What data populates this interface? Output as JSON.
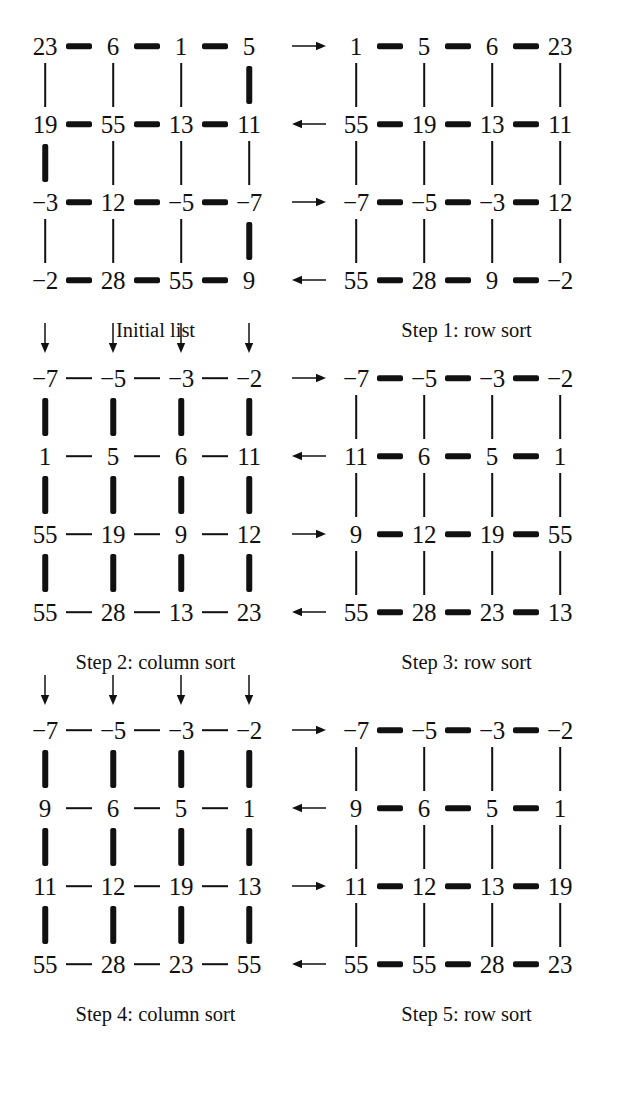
{
  "figure": {
    "ink_color": "#111111",
    "background_color": "#ffffff"
  },
  "chart_data": {
    "type": "diagram",
    "grid": {
      "rows": 4,
      "cols": 4
    },
    "panels": [
      {
        "id": "initial",
        "caption": "Initial list",
        "sort_kind": "none",
        "rows": [
          [
            "23",
            "6",
            "1",
            "5"
          ],
          [
            "19",
            "55",
            "13",
            "11"
          ],
          [
            "−3",
            "12",
            "−5",
            "−7"
          ],
          [
            "−2",
            "28",
            "55",
            "9"
          ]
        ],
        "row_arrows": [],
        "col_arrows": [],
        "h_edges": [
          [
            "thick",
            "thick",
            "thick"
          ],
          [
            "thick",
            "thick",
            "thick"
          ],
          [
            "thick",
            "thick",
            "thick"
          ],
          [
            "thick",
            "thick",
            "thick"
          ]
        ],
        "v_edges": [
          [
            "thin",
            "thin",
            "thin",
            "thick"
          ],
          [
            "thick",
            "thin",
            "thin",
            "thin"
          ],
          [
            "thin",
            "thin",
            "thin",
            "thick"
          ]
        ]
      },
      {
        "id": "step1",
        "caption": "Step 1: row sort",
        "sort_kind": "row",
        "rows": [
          [
            "1",
            "5",
            "6",
            "23"
          ],
          [
            "55",
            "19",
            "13",
            "11"
          ],
          [
            "−7",
            "−5",
            "−3",
            "12"
          ],
          [
            "55",
            "28",
            "9",
            "−2"
          ]
        ],
        "row_arrows": [
          "right",
          "left",
          "right",
          "left"
        ],
        "col_arrows": [],
        "h_edges": [
          [
            "thick",
            "thick",
            "thick"
          ],
          [
            "thick",
            "thick",
            "thick"
          ],
          [
            "thick",
            "thick",
            "thick"
          ],
          [
            "thick",
            "thick",
            "thick"
          ]
        ],
        "v_edges": [
          [
            "thin",
            "thin",
            "thin",
            "thin"
          ],
          [
            "thin",
            "thin",
            "thin",
            "thin"
          ],
          [
            "thin",
            "thin",
            "thin",
            "thin"
          ]
        ]
      },
      {
        "id": "step2",
        "caption": "Step 2: column sort",
        "sort_kind": "column",
        "rows": [
          [
            "−7",
            "−5",
            "−3",
            "−2"
          ],
          [
            "1",
            "5",
            "6",
            "11"
          ],
          [
            "55",
            "19",
            "9",
            "12"
          ],
          [
            "55",
            "28",
            "13",
            "23"
          ]
        ],
        "row_arrows": [],
        "col_arrows": [
          "down",
          "down",
          "down",
          "down"
        ],
        "h_edges": [
          [
            "thin",
            "thin",
            "thin"
          ],
          [
            "thin",
            "thin",
            "thin"
          ],
          [
            "thin",
            "thin",
            "thin"
          ],
          [
            "thin",
            "thin",
            "thin"
          ]
        ],
        "v_edges": [
          [
            "thick",
            "thick",
            "thick",
            "thick"
          ],
          [
            "thick",
            "thick",
            "thick",
            "thick"
          ],
          [
            "thick",
            "thick",
            "thick",
            "thick"
          ]
        ]
      },
      {
        "id": "step3",
        "caption": "Step 3: row sort",
        "sort_kind": "row",
        "rows": [
          [
            "−7",
            "−5",
            "−3",
            "−2"
          ],
          [
            "11",
            "6",
            "5",
            "1"
          ],
          [
            "9",
            "12",
            "19",
            "55"
          ],
          [
            "55",
            "28",
            "23",
            "13"
          ]
        ],
        "row_arrows": [
          "right",
          "left",
          "right",
          "left"
        ],
        "col_arrows": [],
        "h_edges": [
          [
            "thick",
            "thick",
            "thick"
          ],
          [
            "thick",
            "thick",
            "thick"
          ],
          [
            "thick",
            "thick",
            "thick"
          ],
          [
            "thick",
            "thick",
            "thick"
          ]
        ],
        "v_edges": [
          [
            "thin",
            "thin",
            "thin",
            "thin"
          ],
          [
            "thin",
            "thin",
            "thin",
            "thin"
          ],
          [
            "thin",
            "thin",
            "thin",
            "thin"
          ]
        ]
      },
      {
        "id": "step4",
        "caption": "Step 4: column sort",
        "sort_kind": "column",
        "rows": [
          [
            "−7",
            "−5",
            "−3",
            "−2"
          ],
          [
            "9",
            "6",
            "5",
            "1"
          ],
          [
            "11",
            "12",
            "19",
            "13"
          ],
          [
            "55",
            "28",
            "23",
            "55"
          ]
        ],
        "row_arrows": [],
        "col_arrows": [
          "down",
          "down",
          "down",
          "down"
        ],
        "h_edges": [
          [
            "thin",
            "thin",
            "thin"
          ],
          [
            "thin",
            "thin",
            "thin"
          ],
          [
            "thin",
            "thin",
            "thin"
          ],
          [
            "thin",
            "thin",
            "thin"
          ]
        ],
        "v_edges": [
          [
            "thick",
            "thick",
            "thick",
            "thick"
          ],
          [
            "thick",
            "thick",
            "thick",
            "thick"
          ],
          [
            "thick",
            "thick",
            "thick",
            "thick"
          ]
        ]
      },
      {
        "id": "step5",
        "caption": "Step 5: row sort",
        "sort_kind": "row",
        "rows": [
          [
            "−7",
            "−5",
            "−3",
            "−2"
          ],
          [
            "9",
            "6",
            "5",
            "1"
          ],
          [
            "11",
            "12",
            "13",
            "19"
          ],
          [
            "55",
            "55",
            "28",
            "23"
          ]
        ],
        "row_arrows": [
          "right",
          "left",
          "right",
          "left"
        ],
        "col_arrows": [],
        "h_edges": [
          [
            "thick",
            "thick",
            "thick"
          ],
          [
            "thick",
            "thick",
            "thick"
          ],
          [
            "thick",
            "thick",
            "thick"
          ],
          [
            "thick",
            "thick",
            "thick"
          ]
        ],
        "v_edges": [
          [
            "thin",
            "thin",
            "thin",
            "thin"
          ],
          [
            "thin",
            "thin",
            "thin",
            "thin"
          ],
          [
            "thin",
            "thin",
            "thin",
            "thin"
          ]
        ]
      }
    ]
  },
  "icons": {
    "arrow_right": "arrow-right-icon",
    "arrow_left": "arrow-left-icon",
    "arrow_down": "arrow-down-icon"
  }
}
